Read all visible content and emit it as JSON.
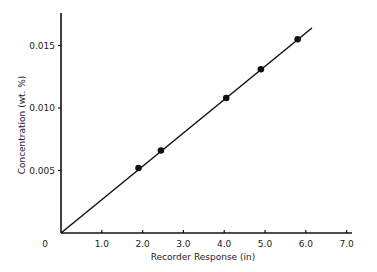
{
  "chart_data": {
    "type": "scatter",
    "title": "",
    "xlabel": "Recorder Response (in)",
    "ylabel": "Concentration (wt. %)",
    "xlim": [
      0,
      7.3
    ],
    "ylim": [
      0,
      0.0177
    ],
    "x_ticks": [
      "0",
      "1.0",
      "2.0",
      "3.0",
      "4.0",
      "5.0",
      "6.0",
      "7.0"
    ],
    "y_ticks": [
      "0.005",
      "0.010",
      "0.015"
    ],
    "grid": false,
    "legend": null,
    "series": [
      {
        "name": "Measured",
        "marker": "filled-circle",
        "x": [
          1.9,
          2.45,
          4.05,
          4.9,
          5.8
        ],
        "y": [
          0.0052,
          0.0066,
          0.0108,
          0.0131,
          0.0155
        ]
      }
    ],
    "fit_line": {
      "x": [
        0,
        6.15
      ],
      "y": [
        0,
        0.0164
      ]
    }
  }
}
